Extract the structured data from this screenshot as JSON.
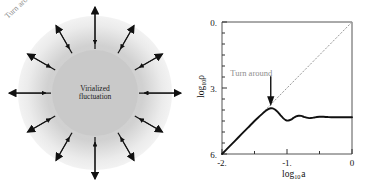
{
  "figure": {
    "left_panel": {
      "core_label_line1": "Virialized",
      "core_label_line2": "fluctuation",
      "turn_around_label": "Turn around",
      "arrow_count": 12,
      "core_color": "#c9c9c9",
      "halo_color": "#dcdcdc",
      "arrow_color": "#111111",
      "label_color": "#8d8d8d"
    }
  },
  "chart_data": {
    "type": "line",
    "title": "",
    "xlabel": "log10 a",
    "ylabel": "log10 rho",
    "xlabel_base": "log",
    "xlabel_sub": "10",
    "xlabel_var": "a",
    "ylabel_base": "log",
    "ylabel_sub": "10",
    "ylabel_var": "ρ",
    "xlim": [
      -2,
      0
    ],
    "ylim": [
      6,
      0
    ],
    "y_inverted": true,
    "grid": false,
    "legend": null,
    "xticks": [
      -2,
      -1,
      0
    ],
    "xticklabels": [
      "-2.",
      "-1.",
      "0"
    ],
    "yticks": [
      0,
      3,
      6
    ],
    "yticklabels": [
      "0.",
      "3.",
      "6."
    ],
    "minor_tick_step": 0.5,
    "annotations": [
      {
        "text": "Turn around",
        "x": -1.55,
        "y": 2.45,
        "color": "#8d8d8d"
      },
      {
        "text": "arrow-marker",
        "x": -1.25,
        "y": 3.3,
        "color": "#111111"
      }
    ],
    "series": [
      {
        "name": "density",
        "style": "solid",
        "color": "#111111",
        "x": [
          -2.0,
          -1.9,
          -1.8,
          -1.7,
          -1.6,
          -1.5,
          -1.42,
          -1.36,
          -1.32,
          -1.28,
          -1.25,
          -1.22,
          -1.18,
          -1.14,
          -1.1,
          -1.06,
          -1.02,
          -0.98,
          -0.94,
          -0.9,
          -0.86,
          -0.82,
          -0.78,
          -0.74,
          -0.7,
          -0.66,
          -0.62,
          -0.58,
          -0.54,
          -0.5,
          -0.44,
          -0.38,
          -0.32,
          -0.26,
          -0.2,
          -0.14,
          -0.08,
          0.0
        ],
        "y": [
          6.0,
          5.7,
          5.4,
          5.1,
          4.8,
          4.5,
          4.28,
          4.12,
          4.02,
          3.95,
          3.92,
          3.93,
          3.99,
          4.1,
          4.24,
          4.37,
          4.46,
          4.48,
          4.44,
          4.36,
          4.29,
          4.26,
          4.27,
          4.31,
          4.35,
          4.37,
          4.36,
          4.34,
          4.32,
          4.31,
          4.31,
          4.32,
          4.33,
          4.33,
          4.33,
          4.33,
          4.33,
          4.33
        ]
      },
      {
        "name": "linear-extrapolation",
        "style": "dotted",
        "color": "#9a9a9a",
        "x": [
          -2.0,
          0.0
        ],
        "y": [
          6.0,
          0.0
        ]
      }
    ],
    "turnaround_point": {
      "x": -1.25,
      "y": 3.92
    }
  }
}
